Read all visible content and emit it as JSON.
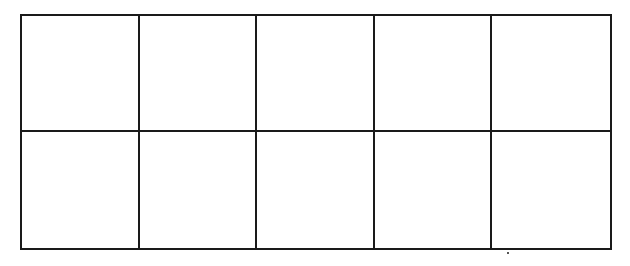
{
  "ten_frame": {
    "rows": 2,
    "columns": 5,
    "cells": [
      {
        "row": 1,
        "col": 1,
        "content": ""
      },
      {
        "row": 1,
        "col": 2,
        "content": ""
      },
      {
        "row": 1,
        "col": 3,
        "content": ""
      },
      {
        "row": 1,
        "col": 4,
        "content": ""
      },
      {
        "row": 1,
        "col": 5,
        "content": ""
      },
      {
        "row": 2,
        "col": 1,
        "content": ""
      },
      {
        "row": 2,
        "col": 2,
        "content": ""
      },
      {
        "row": 2,
        "col": 3,
        "content": ""
      },
      {
        "row": 2,
        "col": 4,
        "content": ""
      },
      {
        "row": 2,
        "col": 5,
        "content": ""
      }
    ],
    "line_color": "#1a1a1a",
    "background_color": "#ffffff"
  }
}
